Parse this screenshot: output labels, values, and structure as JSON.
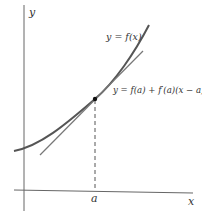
{
  "diagram": {
    "labels": {
      "y_axis": "y",
      "x_axis": "x",
      "point_a": "a",
      "curve": "y = f(x)",
      "tangent": "y = f(a) + f′(a)(x − a)"
    },
    "colors": {
      "curve": "#555555",
      "tangent": "#777777",
      "axes": "#666666",
      "dashed": "#555555",
      "point": "#111111",
      "text": "#333333"
    },
    "elements": [
      {
        "type": "curve",
        "name": "y = f(x)",
        "shape": "convex increasing"
      },
      {
        "type": "tangent-line",
        "name": "y = f(a) + f′(a)(x − a)",
        "touches_at": "a"
      },
      {
        "type": "point",
        "at": "(a, f(a))"
      },
      {
        "type": "dashed-line",
        "from": "(a, f(a))",
        "to": "(a, 0)"
      }
    ]
  }
}
